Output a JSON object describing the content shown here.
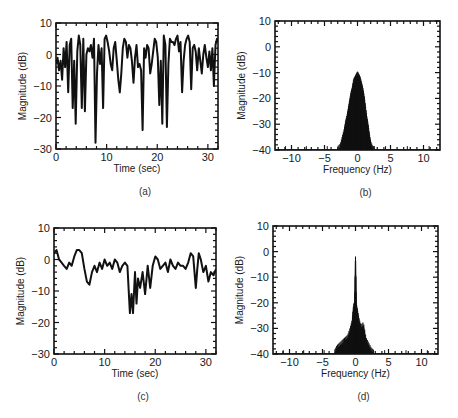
{
  "chart_data": [
    {
      "id": "a",
      "type": "line",
      "panel_label": "(a)",
      "xlabel": "Time (sec)",
      "ylabel": "Magnitude (dB)",
      "xlim": [
        0,
        32
      ],
      "ylim": [
        -30,
        10
      ],
      "xticks": [
        0,
        10,
        20,
        30
      ],
      "yticks": [
        10,
        0,
        -10,
        -20,
        -30
      ],
      "grid": false,
      "box": {
        "left": 56,
        "top": 23,
        "right": 218,
        "bottom": 149
      },
      "series": [
        {
          "name": "fading envelope",
          "x": [
            0,
            0.3,
            0.6,
            0.9,
            1.2,
            1.5,
            1.8,
            2.1,
            2.4,
            2.7,
            3.0,
            3.3,
            3.6,
            3.9,
            4.2,
            4.5,
            4.8,
            5.1,
            5.4,
            5.7,
            6.0,
            6.3,
            6.6,
            6.9,
            7.2,
            7.5,
            7.8,
            8.1,
            8.4,
            8.7,
            9.0,
            9.3,
            9.6,
            9.9,
            10.2,
            10.5,
            10.8,
            11.1,
            11.4,
            11.7,
            12.0,
            12.3,
            12.6,
            12.9,
            13.2,
            13.5,
            13.8,
            14.1,
            14.4,
            14.7,
            15.0,
            15.3,
            15.6,
            15.9,
            16.2,
            16.5,
            16.8,
            17.1,
            17.4,
            17.7,
            18.0,
            18.3,
            18.6,
            18.9,
            19.2,
            19.5,
            19.8,
            20.1,
            20.4,
            20.7,
            21.0,
            21.3,
            21.6,
            21.9,
            22.2,
            22.5,
            22.8,
            23.1,
            23.4,
            23.7,
            24.0,
            24.3,
            24.6,
            24.9,
            25.2,
            25.5,
            25.8,
            26.1,
            26.4,
            26.7,
            27.0,
            27.3,
            27.6,
            27.9,
            28.2,
            28.5,
            28.8,
            29.1,
            29.4,
            29.7,
            30.0,
            30.3,
            30.6,
            30.9,
            31.2,
            31.5,
            31.8,
            32.0
          ],
          "y": [
            -3,
            -1,
            -5,
            -2,
            -8,
            2,
            -4,
            4,
            -12,
            3,
            5,
            -17,
            -2,
            -22,
            1,
            6,
            3,
            -17,
            5,
            -18,
            0,
            2,
            1,
            3,
            -1,
            5,
            -28,
            -6,
            3,
            -3,
            2,
            -17,
            5,
            6,
            4,
            1,
            -3,
            -5,
            2,
            4,
            -2,
            -8,
            -12,
            -6,
            2,
            5,
            4,
            -1,
            3,
            2,
            -2,
            -9,
            -1,
            3,
            -4,
            -3,
            -5,
            -24,
            2,
            -1,
            3,
            2,
            -6,
            -3,
            1,
            5,
            4,
            -1,
            -16,
            -2,
            -22,
            6,
            3,
            -23,
            -3,
            5,
            4,
            4,
            3,
            5,
            6,
            1,
            4,
            -12,
            -2,
            3,
            5,
            6,
            4,
            -11,
            2,
            3,
            1,
            -5,
            2,
            -2,
            -6,
            0,
            3,
            -1,
            -4,
            1,
            -5,
            2,
            -10,
            3,
            5,
            4
          ]
        }
      ]
    },
    {
      "id": "b",
      "type": "line",
      "panel_label": "(b)",
      "xlabel": "Frequency (Hz)",
      "ylabel": "Magnitude (dB)",
      "xlim": [
        -12.5,
        12.5
      ],
      "ylim": [
        -40,
        10
      ],
      "xticks": [
        -10,
        -5,
        0,
        5,
        10
      ],
      "yticks": [
        10,
        0,
        -10,
        -20,
        -30,
        -40
      ],
      "grid": false,
      "box": {
        "left": 275,
        "top": 21,
        "right": 440,
        "bottom": 150
      },
      "series": [
        {
          "name": "Doppler spectrum",
          "x": [
            -12.5,
            -3,
            -2.6,
            -2.3,
            -2.0,
            -1.8,
            -1.6,
            -1.4,
            -1.2,
            -1.0,
            -0.8,
            -0.6,
            -0.4,
            -0.2,
            0,
            0.2,
            0.4,
            0.6,
            0.8,
            1.0,
            1.2,
            1.4,
            1.6,
            1.8,
            2.0,
            2.3,
            2.6,
            12.5
          ],
          "y": [
            -40,
            -40,
            -39,
            -36,
            -33,
            -30,
            -28,
            -25,
            -22,
            -19,
            -17,
            -14,
            -13,
            -12,
            -11,
            -12,
            -13,
            -15,
            -17,
            -20,
            -24,
            -28,
            -31,
            -35,
            -38,
            -40,
            -40,
            -40
          ],
          "envelope_min": [
            -40,
            -40,
            -40,
            -40,
            -40,
            -38,
            -36,
            -34,
            -31,
            -28,
            -26,
            -24,
            -22,
            -24,
            -38,
            -24,
            -22,
            -24,
            -27,
            -30,
            -33,
            -35,
            -38,
            -40,
            -40,
            -40,
            -40,
            -40
          ]
        }
      ]
    },
    {
      "id": "c",
      "type": "line",
      "panel_label": "(c)",
      "xlabel": "Time (sec)",
      "ylabel": "Magnitude (dB)",
      "xlim": [
        0,
        32
      ],
      "ylim": [
        -30,
        10
      ],
      "xticks": [
        0,
        10,
        20,
        30
      ],
      "yticks": [
        10,
        0,
        -10,
        -20,
        -30
      ],
      "grid": false,
      "box": {
        "left": 54,
        "top": 228,
        "right": 216,
        "bottom": 354
      },
      "series": [
        {
          "name": "fading envelope (with LOS)",
          "x": [
            0,
            0.5,
            1.0,
            1.5,
            2.0,
            2.5,
            3.0,
            3.5,
            4.0,
            4.5,
            5.0,
            5.5,
            6.0,
            6.5,
            7.0,
            7.5,
            8.0,
            8.5,
            9.0,
            9.5,
            10.0,
            10.5,
            11.0,
            11.5,
            12.0,
            12.5,
            13.0,
            13.5,
            14.0,
            14.5,
            15.0,
            15.3,
            15.6,
            16.0,
            16.3,
            16.6,
            17.0,
            17.5,
            18.0,
            18.5,
            19.0,
            19.5,
            20.0,
            20.5,
            21.0,
            21.5,
            22.0,
            22.5,
            23.0,
            23.5,
            24.0,
            24.5,
            25.0,
            25.5,
            26.0,
            26.5,
            27.0,
            27.5,
            28.0,
            28.3,
            28.6,
            29.0,
            29.5,
            30.0,
            30.5,
            31.0,
            31.5,
            32.0
          ],
          "y": [
            2,
            3,
            0,
            -1,
            -2,
            -3,
            -1,
            -2,
            1,
            3,
            3,
            2,
            -3,
            -7,
            -8,
            -4,
            -2,
            -4,
            -1,
            -3,
            0,
            -2,
            -1,
            -3,
            0,
            -1,
            -4,
            -2,
            -1,
            -2,
            -17,
            -11,
            -17,
            -4,
            -14,
            -6,
            -9,
            -4,
            -11,
            -2,
            -9,
            -2,
            1,
            0,
            -3,
            -2,
            -1,
            -4,
            0,
            -2,
            -3,
            -1,
            -2,
            -2,
            -3,
            -1,
            2,
            1,
            -9,
            -3,
            2,
            0,
            -4,
            -2,
            -7,
            -4,
            -5,
            -3
          ]
        }
      ]
    },
    {
      "id": "d",
      "type": "line",
      "panel_label": "(d)",
      "xlabel": "Frequency (Hz)",
      "ylabel": "Magnitude (dB)",
      "xlim": [
        -12.5,
        12.5
      ],
      "ylim": [
        -40,
        10
      ],
      "xticks": [
        -10,
        -5,
        0,
        5,
        10
      ],
      "yticks": [
        10,
        0,
        -10,
        -20,
        -30,
        -40
      ],
      "grid": false,
      "box": {
        "left": 273,
        "top": 226,
        "right": 438,
        "bottom": 354
      },
      "series": [
        {
          "name": "Doppler spectrum (with LOS)",
          "x": [
            -12.5,
            -3.2,
            -2.8,
            -2.4,
            -2.0,
            -1.6,
            -1.2,
            -0.8,
            -0.5,
            -0.3,
            -0.1,
            0,
            0.1,
            0.3,
            0.5,
            0.8,
            1.2,
            1.6,
            2.0,
            2.4,
            2.8,
            12.5
          ],
          "y": [
            -40,
            -40,
            -38,
            -37,
            -36,
            -35,
            -34,
            -31,
            -28,
            -22,
            -21,
            -2,
            -21,
            -24,
            -27,
            -30,
            -29,
            -35,
            -37,
            -39,
            -40,
            -40
          ],
          "envelope_min": [
            -40,
            -40,
            -40,
            -40,
            -40,
            -40,
            -40,
            -39,
            -38,
            -36,
            -34,
            -40,
            -34,
            -36,
            -38,
            -40,
            -40,
            -40,
            -40,
            -40,
            -40,
            -40
          ]
        }
      ]
    }
  ]
}
